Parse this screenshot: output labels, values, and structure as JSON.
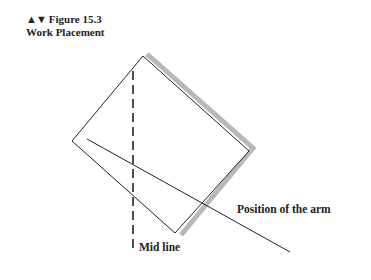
{
  "figure": {
    "markers": "▲▼",
    "number_label": "Figure 15.3",
    "title": "Work Placement"
  },
  "labels": {
    "arm": "Position of the arm",
    "midline": "Mid line"
  },
  "colors": {
    "line": "#222222",
    "shadow": "#b8b8b8"
  }
}
